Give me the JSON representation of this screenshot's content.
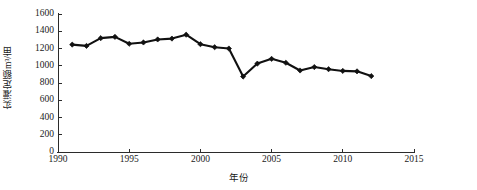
{
  "chart_data": {
    "type": "line",
    "title": "",
    "subtitle": "",
    "xlabel": "年份",
    "ylabel": "实灌定额m³/亩",
    "xlim": [
      1990,
      2015
    ],
    "ylim": [
      0,
      1600
    ],
    "xticks": [
      1990,
      1995,
      2000,
      2005,
      2010,
      2015
    ],
    "yticks": [
      0,
      200,
      400,
      600,
      800,
      1000,
      1200,
      1400,
      1600
    ],
    "grid": false,
    "legend": null,
    "marker": "diamond",
    "line_color": "#111111",
    "x": [
      1991,
      1992,
      1993,
      1994,
      1995,
      1996,
      1997,
      1998,
      1999,
      2000,
      2001,
      2002,
      2003,
      2004,
      2005,
      2006,
      2007,
      2008,
      2009,
      2010,
      2011,
      2012
    ],
    "values": [
      1245,
      1230,
      1320,
      1335,
      1255,
      1270,
      1305,
      1315,
      1360,
      1250,
      1215,
      1200,
      875,
      1025,
      1080,
      1035,
      945,
      985,
      960,
      940,
      935,
      880
    ],
    "series": [
      {
        "name": "实灌定额",
        "x": [
          1991,
          1992,
          1993,
          1994,
          1995,
          1996,
          1997,
          1998,
          1999,
          2000,
          2001,
          2002,
          2003,
          2004,
          2005,
          2006,
          2007,
          2008,
          2009,
          2010,
          2011,
          2012
        ],
        "values": [
          1245,
          1230,
          1320,
          1335,
          1255,
          1270,
          1305,
          1315,
          1360,
          1250,
          1215,
          1200,
          875,
          1025,
          1080,
          1035,
          945,
          985,
          960,
          940,
          935,
          880
        ]
      }
    ]
  },
  "axes": {
    "y_title": "实灌定额m³/亩",
    "x_title": "年份",
    "y_tick_labels": [
      "1600",
      "1400",
      "1200",
      "1000",
      "800",
      "600",
      "400",
      "200",
      "0"
    ],
    "x_tick_labels": [
      "1990",
      "1995",
      "2000",
      "2005",
      "2010",
      "2015"
    ]
  }
}
